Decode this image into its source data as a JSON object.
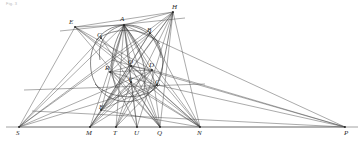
{
  "figure": {
    "caption_note": "Fig. 3",
    "stroke_color": "#444444",
    "baseline_color": "#555555",
    "conic_color": "#3a3a3a",
    "background_color": "#ffffff",
    "width": 364,
    "height": 142
  },
  "points": [
    {
      "id": "E",
      "label": "E",
      "x": 75,
      "y": 27,
      "lx": 69,
      "ly": 19
    },
    {
      "id": "A",
      "label": "A",
      "x": 124,
      "y": 25,
      "lx": 120,
      "ly": 16
    },
    {
      "id": "H",
      "label": "H",
      "x": 173,
      "y": 12,
      "lx": 172,
      "ly": 4
    },
    {
      "id": "G",
      "label": "G",
      "x": 101,
      "y": 38,
      "lx": 97,
      "ly": 32
    },
    {
      "id": "B",
      "label": "B",
      "x": 150,
      "y": 33,
      "lx": 147,
      "ly": 27
    },
    {
      "id": "O",
      "label": "O",
      "x": 131,
      "y": 66,
      "lx": 128,
      "ly": 59
    },
    {
      "id": "D",
      "label": "D",
      "x": 152,
      "y": 70,
      "lx": 149,
      "ly": 62
    },
    {
      "id": "R",
      "label": "R",
      "x": 110,
      "y": 72,
      "lx": 105,
      "ly": 65
    },
    {
      "id": "V",
      "label": "V",
      "x": 131,
      "y": 82,
      "lx": 128,
      "ly": 77
    },
    {
      "id": "C",
      "label": "C",
      "x": 157,
      "y": 85,
      "lx": 155,
      "ly": 79
    },
    {
      "id": "F",
      "label": "F",
      "x": 101,
      "y": 110,
      "lx": 99,
      "ly": 104
    },
    {
      "id": "S",
      "label": "S",
      "x": 19,
      "y": 127,
      "lx": 16,
      "ly": 130
    },
    {
      "id": "M",
      "label": "M",
      "x": 90,
      "y": 127,
      "lx": 86,
      "ly": 130
    },
    {
      "id": "T",
      "label": "T",
      "x": 116,
      "y": 127,
      "lx": 113,
      "ly": 130
    },
    {
      "id": "U",
      "label": "U",
      "x": 137,
      "y": 127,
      "lx": 134,
      "ly": 130
    },
    {
      "id": "Q",
      "label": "Q",
      "x": 160,
      "y": 127,
      "lx": 157,
      "ly": 130
    },
    {
      "id": "N",
      "label": "N",
      "x": 200,
      "y": 127,
      "lx": 197,
      "ly": 130
    },
    {
      "id": "P",
      "label": "P",
      "x": 345,
      "y": 127,
      "lx": 344,
      "ly": 130
    }
  ],
  "baseline": {
    "x1": 6,
    "y1": 127,
    "x2": 358,
    "y2": 127
  },
  "segments": [
    {
      "from": "S",
      "to": "P"
    },
    {
      "from": "E",
      "to": "A"
    },
    {
      "from": "A",
      "to": "H"
    },
    {
      "from": "E",
      "to": "H"
    },
    {
      "from": "E",
      "to": "S"
    },
    {
      "from": "E",
      "to": "D"
    },
    {
      "from": "E",
      "to": "C"
    },
    {
      "from": "E",
      "to": "Q"
    },
    {
      "from": "E",
      "to": "N"
    },
    {
      "from": "A",
      "to": "S"
    },
    {
      "from": "A",
      "to": "M"
    },
    {
      "from": "A",
      "to": "T"
    },
    {
      "from": "A",
      "to": "U"
    },
    {
      "from": "A",
      "to": "Q"
    },
    {
      "from": "A",
      "to": "N"
    },
    {
      "from": "A",
      "to": "P"
    },
    {
      "from": "A",
      "to": "F"
    },
    {
      "from": "A",
      "to": "V"
    },
    {
      "from": "A",
      "to": "R"
    },
    {
      "from": "A",
      "to": "D"
    },
    {
      "from": "A",
      "to": "C"
    },
    {
      "from": "A",
      "to": "O"
    },
    {
      "from": "H",
      "to": "M"
    },
    {
      "from": "H",
      "to": "T"
    },
    {
      "from": "H",
      "to": "U"
    },
    {
      "from": "H",
      "to": "Q"
    },
    {
      "from": "H",
      "to": "F"
    },
    {
      "from": "H",
      "to": "R"
    },
    {
      "from": "H",
      "to": "S"
    },
    {
      "from": "D",
      "to": "M"
    },
    {
      "from": "D",
      "to": "T"
    },
    {
      "from": "D",
      "to": "F"
    },
    {
      "from": "D",
      "to": "S"
    },
    {
      "from": "D",
      "to": "R"
    },
    {
      "from": "R",
      "to": "Q"
    },
    {
      "from": "R",
      "to": "N"
    },
    {
      "from": "R",
      "to": "U"
    },
    {
      "from": "R",
      "to": "C"
    },
    {
      "from": "C",
      "to": "M"
    },
    {
      "from": "C",
      "to": "T"
    },
    {
      "from": "C",
      "to": "F"
    },
    {
      "from": "C",
      "to": "P"
    },
    {
      "from": "O",
      "to": "M"
    },
    {
      "from": "O",
      "to": "Q"
    },
    {
      "from": "O",
      "to": "N"
    },
    {
      "from": "V",
      "to": "M"
    },
    {
      "from": "V",
      "to": "T"
    },
    {
      "from": "V",
      "to": "U"
    },
    {
      "from": "V",
      "to": "Q"
    },
    {
      "from": "V",
      "to": "N"
    },
    {
      "from": "V",
      "to": "F"
    },
    {
      "from": "G",
      "to": "N"
    },
    {
      "from": "G",
      "to": "Q"
    },
    {
      "from": "B",
      "to": "N"
    },
    {
      "from": "B",
      "to": "F"
    },
    {
      "from": "B",
      "to": "M"
    },
    {
      "from": "D",
      "to": "N"
    },
    {
      "from": "D",
      "to": "Q"
    },
    {
      "from": "D",
      "to": "P"
    },
    {
      "from": "O",
      "to": "D"
    },
    {
      "from": "O",
      "to": "R"
    },
    {
      "from": "F",
      "to": "N"
    },
    {
      "from": "H",
      "to": "N"
    },
    {
      "from": "S",
      "to": "C"
    },
    {
      "from": "S",
      "to": "G"
    },
    {
      "from": "S",
      "to": "B"
    }
  ],
  "free_lines": [
    {
      "name": "transversal-upper",
      "x1": 60,
      "y1": 31,
      "x2": 185,
      "y2": 18
    },
    {
      "name": "transversal-lower",
      "x1": 24,
      "y1": 90,
      "x2": 205,
      "y2": 84
    },
    {
      "name": "transversal-right",
      "x1": 112,
      "y1": 60,
      "x2": 345,
      "y2": 127
    },
    {
      "name": "transversal-long",
      "x1": 32,
      "y1": 111,
      "x2": 345,
      "y2": 127
    }
  ],
  "conics": [
    {
      "name": "main-conic",
      "d": "M 124 25 C 99 27 88 48 91 70 C 94 92 114 105 134 101 C 154 97 166 76 162 55 C 158 35 144 24 124 25 Z"
    },
    {
      "name": "left-arc",
      "d": "M 124 25 C 105 29 97 45 100 60"
    },
    {
      "name": "right-arc",
      "d": "M 124 25 C 148 27 160 42 161 58"
    },
    {
      "name": "inner-arc-left",
      "d": "M 124 25 C 112 44 108 66 116 88"
    },
    {
      "name": "inner-arc-right",
      "d": "M 124 25 C 140 45 148 68 144 90"
    },
    {
      "name": "lower-arc",
      "d": "M 95 84 C 110 100 145 102 160 84"
    },
    {
      "name": "upper-cap",
      "d": "M 96 40 C 114 26 146 27 160 44"
    },
    {
      "name": "h-arc",
      "d": "M 173 12 C 168 38 165 62 157 85"
    }
  ],
  "vertices_shown": [
    "A",
    "H",
    "E",
    "D",
    "R",
    "O",
    "V",
    "C",
    "G",
    "B",
    "F",
    "S",
    "M",
    "T",
    "U",
    "Q",
    "N",
    "P"
  ]
}
